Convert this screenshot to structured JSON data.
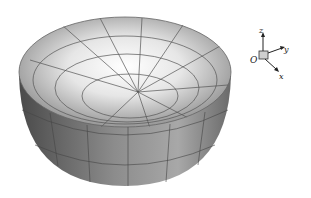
{
  "figure": {
    "colors": {
      "outer_dark": "#3c3c3c",
      "outer_light": "#9a9a9a",
      "inner_highlight": "#ffffff",
      "grid": "#444444"
    }
  },
  "axes": {
    "origin_label": "O",
    "x_label": "x",
    "y_label": "y",
    "z_label": "z"
  }
}
